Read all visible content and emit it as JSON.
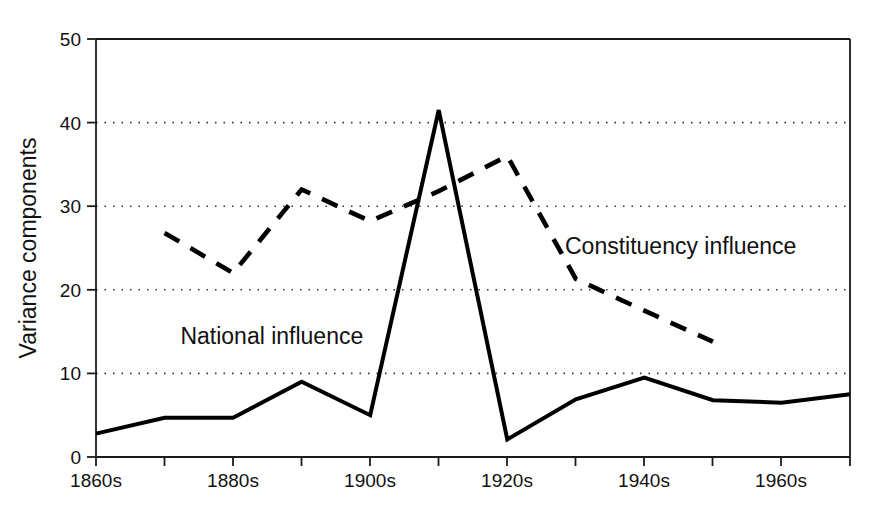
{
  "chart_data": {
    "type": "line",
    "title": "",
    "subtitle": "",
    "xlabel": "",
    "ylabel": "Variance components",
    "x": [
      "1860s",
      "1870s",
      "1880s",
      "1890s",
      "1900s",
      "1910s",
      "1920s",
      "1930s",
      "1940s",
      "1950s",
      "1960s",
      "1970s"
    ],
    "xtick_labels_shown": [
      "1860s",
      "1880s",
      "1900s",
      "1920s",
      "1940s",
      "1960s"
    ],
    "xtick_all_positions": [
      "1860s",
      "1870s",
      "1880s",
      "1890s",
      "1900s",
      "1910s",
      "1920s",
      "1930s",
      "1940s",
      "1950s",
      "1960s",
      "1970s"
    ],
    "ylim": [
      0,
      50
    ],
    "ytick_labels": [
      "0",
      "10",
      "20",
      "30",
      "40",
      "50"
    ],
    "ytick_values": [
      0,
      10,
      20,
      30,
      40,
      50
    ],
    "grid": "horizontal-dotted",
    "legend_position": "inline-annotations",
    "series": [
      {
        "name": "National influence",
        "style": "solid",
        "color": "#000000",
        "x": [
          "1860s",
          "1870s",
          "1880s",
          "1890s",
          "1900s",
          "1910s",
          "1920s",
          "1930s",
          "1940s",
          "1950s",
          "1960s",
          "1970s"
        ],
        "values": [
          2.8,
          4.7,
          4.7,
          9.0,
          5.0,
          41.5,
          2.1,
          6.9,
          9.5,
          6.8,
          6.5,
          7.5
        ]
      },
      {
        "name": "Constituency influence",
        "style": "dashed",
        "color": "#000000",
        "x": [
          "1870s",
          "1880s",
          "1890s",
          "1900s",
          "1910s",
          "1920s",
          "1930s",
          "1940s",
          "1950s"
        ],
        "values": [
          26.8,
          22.0,
          32.0,
          28.2,
          31.8,
          36.0,
          21.3,
          17.5,
          13.8
        ]
      }
    ],
    "annotations": [
      {
        "text": "National influence",
        "series": "National influence",
        "x_frac": 0.112,
        "y_value": 13.5
      },
      {
        "text": "Constituency influence",
        "series": "Constituency influence",
        "x_frac": 0.622,
        "y_value": 24.3
      }
    ]
  },
  "axes": {
    "y_axis_title": "Variance components",
    "y_ticks": [
      "50",
      "40",
      "30",
      "20",
      "10",
      "0"
    ],
    "x_ticks": [
      "1860s",
      "1880s",
      "1900s",
      "1920s",
      "1940s",
      "1960s"
    ]
  },
  "colors": {
    "line": "#000000",
    "grid": "#444444",
    "frame": "#1a1a1a",
    "background": "#ffffff"
  }
}
